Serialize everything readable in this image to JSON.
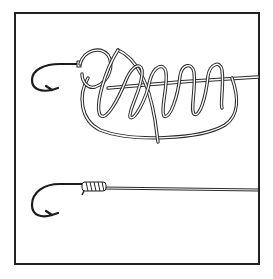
{
  "figure": {
    "panels": [
      {
        "id": "top",
        "description": "line looped through hook eye with loose wraps around standing line (knot being tied)"
      },
      {
        "id": "bottom",
        "description": "finished knot snugged against hook eye"
      }
    ],
    "colors": {
      "ink": "#222222",
      "background": "#ffffff"
    },
    "frame": {
      "x": 15,
      "y": 13,
      "width": 244,
      "height": 251
    }
  }
}
